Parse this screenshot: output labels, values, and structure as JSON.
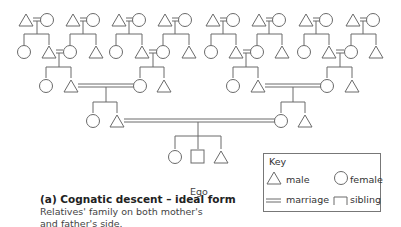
{
  "diagram": {
    "title": "Cognatic descent – ideal form",
    "caption_prefix": "(a)",
    "caption_title": "(a) Cognatic descent – ideal form",
    "caption_desc_line1": "Relatives' family on both mother's",
    "caption_desc_line2": "and father's side.",
    "ego_label": "Ego",
    "line_color": "#6a6a6a",
    "generations": [
      {
        "level": 1,
        "couples": 8,
        "description": "great-grandparent couples (triangle = circle)"
      },
      {
        "level": 2,
        "description": "children of each couple: female + male, or male + female; four marriages link them"
      },
      {
        "level": 3,
        "description": "two sibling sets; one male marries one female"
      },
      {
        "level": 4,
        "description": "Ego with sister (left) and brother (right)"
      }
    ]
  },
  "key": {
    "title": "Key",
    "items": [
      {
        "symbol": "triangle",
        "label": "male"
      },
      {
        "symbol": "circle",
        "label": "female"
      },
      {
        "symbol": "double-line",
        "label": "marriage"
      },
      {
        "symbol": "bracket",
        "label": "sibling"
      }
    ]
  }
}
